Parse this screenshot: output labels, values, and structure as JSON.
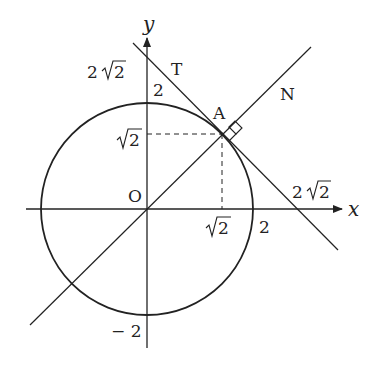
{
  "diagram": {
    "type": "coordinate-geometry",
    "colors": {
      "stroke": "#222222",
      "background": "#ffffff"
    },
    "axes": {
      "x_label": "x",
      "y_label": "y",
      "origin_label": "O"
    },
    "points": {
      "A": {
        "label": "A",
        "coords": [
          "√2",
          "√2"
        ]
      }
    },
    "lines": {
      "tangent": {
        "label": "T"
      },
      "normal": {
        "label": "N"
      }
    },
    "tick_labels": {
      "y_top_circle": "2",
      "y_tangent_intercept_prefix": "2",
      "y_tangent_intercept_root": "2",
      "y_root2_root": "2",
      "y_neg2": "− 2",
      "x_root2_root": "2",
      "x_circle": "2",
      "x_tangent_intercept_prefix": "2",
      "x_tangent_intercept_root": "2"
    },
    "circle": {
      "radius": "2",
      "center": "O"
    }
  }
}
